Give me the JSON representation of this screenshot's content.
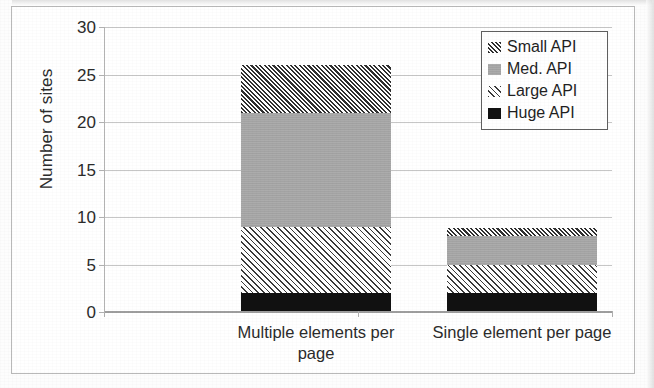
{
  "chart_data": {
    "type": "bar",
    "subtype": "stacked-bar",
    "title": "",
    "xlabel": "",
    "ylabel": "Number of sites",
    "categories": [
      "Multiple elements per page",
      "Single element per page"
    ],
    "category_lines": [
      [
        "Multiple elements per",
        "page"
      ],
      [
        "Single element per page"
      ]
    ],
    "series": [
      {
        "name": "Huge API",
        "values": [
          2,
          2
        ],
        "style": "solid-black",
        "color": "#111111"
      },
      {
        "name": "Large API",
        "values": [
          7,
          3
        ],
        "style": "sparse-hatch",
        "color": "#3a3a3a"
      },
      {
        "name": "Med. API",
        "values": [
          12,
          3
        ],
        "style": "solid-gray",
        "color": "#a8a8a8"
      },
      {
        "name": "Small API",
        "values": [
          5,
          0.8
        ],
        "style": "dense-hatch",
        "color": "#2f2f2f"
      }
    ],
    "stack_order_bottom_to_top": [
      "Huge API",
      "Large API",
      "Med. API",
      "Small API"
    ],
    "totals": [
      26,
      8.8
    ],
    "segment_boundaries": {
      "Multiple elements per page": [
        0,
        2,
        9,
        21,
        26
      ],
      "Single element per page": [
        0,
        2,
        5,
        8,
        8.8
      ]
    },
    "ylim": [
      0,
      30
    ],
    "yticks": [
      0,
      5,
      10,
      15,
      20,
      25,
      30
    ],
    "ytick_labels": [
      "0",
      "5",
      "10",
      "15",
      "20",
      "25",
      "30"
    ],
    "grid": "horizontal",
    "legend_position": "top-right",
    "legend_entries": [
      "Small API",
      "Med. API",
      "Large API",
      "Huge API"
    ]
  },
  "legend": {
    "items": [
      {
        "label": "Small API",
        "swatch": "dense-hatch-swatch"
      },
      {
        "label": "Med. API",
        "swatch": "gray-fill-swatch"
      },
      {
        "label": "Large API",
        "swatch": "sparse-hatch-swatch"
      },
      {
        "label": "Huge API",
        "swatch": "black-fill-swatch"
      }
    ]
  }
}
